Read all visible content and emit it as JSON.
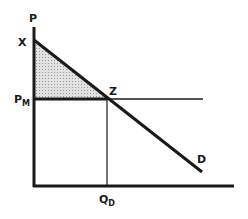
{
  "diagram": {
    "type": "supply-demand / monopoly pricing diagram",
    "labels": {
      "y_axis": "P",
      "intercept": "X",
      "price_level": "P",
      "price_level_sub": "M",
      "intersection": "Z",
      "demand_curve": "D",
      "quantity": "Q",
      "quantity_sub": "D"
    },
    "colors": {
      "line": "#1a1a1a",
      "shaded_region": "#c8c8c8",
      "background": "#ffffff"
    }
  }
}
